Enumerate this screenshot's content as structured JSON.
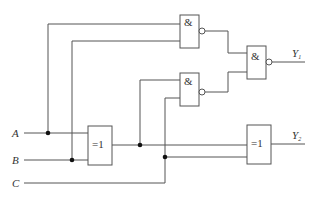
{
  "diagram": {
    "type": "logic-circuit",
    "inputs": [
      {
        "id": "A",
        "label": "A"
      },
      {
        "id": "B",
        "label": "B"
      },
      {
        "id": "C",
        "label": "C"
      }
    ],
    "outputs": [
      {
        "id": "Y1",
        "label": "Y",
        "sub": "1"
      },
      {
        "id": "Y2",
        "label": "Y",
        "sub": "2"
      }
    ],
    "gates": [
      {
        "id": "G1",
        "kind": "NAND",
        "symbol": "&",
        "inputs": [
          "A",
          "B"
        ]
      },
      {
        "id": "G2",
        "kind": "NAND",
        "symbol": "&",
        "inputs": [
          "A⊕B",
          "C"
        ]
      },
      {
        "id": "G3",
        "kind": "NAND",
        "symbol": "&",
        "inputs": [
          "G1",
          "G2"
        ],
        "output": "Y1"
      },
      {
        "id": "X1",
        "kind": "XOR",
        "symbol": "=1",
        "inputs": [
          "A",
          "B"
        ]
      },
      {
        "id": "X2",
        "kind": "XOR",
        "symbol": "=1",
        "inputs": [
          "X1",
          "C"
        ],
        "output": "Y2"
      }
    ]
  }
}
